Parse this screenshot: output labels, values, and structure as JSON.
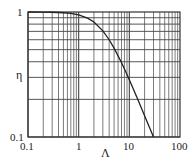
{
  "chart_data": {
    "type": "line",
    "title": "",
    "xlabel": "Λ",
    "ylabel": "η",
    "xscale": "log",
    "yscale": "log",
    "xlim": [
      0.1,
      100
    ],
    "ylim": [
      0.1,
      1
    ],
    "x_ticks": [
      "0.1",
      "1",
      "10",
      "100"
    ],
    "y_ticks": [
      "0.1",
      "1"
    ],
    "grid": true,
    "legend": null,
    "series": [
      {
        "name": "η(Λ)",
        "x": [
          0.1,
          0.2,
          0.3,
          0.5,
          0.7,
          1,
          1.5,
          2,
          3,
          4,
          5,
          7,
          10,
          15,
          20,
          25,
          30
        ],
        "y": [
          1.0,
          0.998,
          0.995,
          0.986,
          0.974,
          0.949,
          0.894,
          0.832,
          0.707,
          0.6,
          0.514,
          0.394,
          0.287,
          0.196,
          0.148,
          0.119,
          0.1
        ]
      }
    ]
  },
  "labels": {
    "y_top": "1",
    "y_bottom": "0.1",
    "x_0": "0.1",
    "x_1": "1",
    "x_2": "10",
    "x_3": "100",
    "xlabel": "Λ",
    "ylabel": "η"
  },
  "colors": {
    "grid": "#444444",
    "curve": "#222222",
    "text": "#222222"
  }
}
